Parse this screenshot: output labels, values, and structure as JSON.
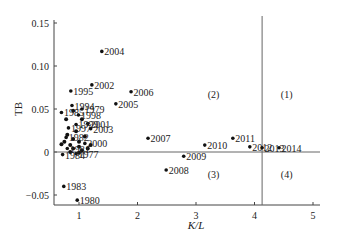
{
  "chart_data": {
    "type": "scatter",
    "title": "",
    "xlabel": "K/L",
    "ylabel": "TB",
    "xlim": [
      0.55,
      5.1
    ],
    "ylim": [
      -0.062,
      0.155
    ],
    "xticks": [
      1,
      2,
      3,
      4,
      5
    ],
    "yticks": [
      0.15,
      0.1,
      0.05,
      0,
      -0.05
    ],
    "ytick_labels": [
      "0.15",
      "0.10",
      "0.05",
      "0",
      "−0.05"
    ],
    "grid": false,
    "reference_lines": {
      "vertical_x": 4.13,
      "horizontal_y": 0
    },
    "quadrant_labels": [
      {
        "label": "(1)",
        "x": 4.55,
        "y": 0.067
      },
      {
        "label": "(2)",
        "x": 3.3,
        "y": 0.067
      },
      {
        "label": "(3)",
        "x": 3.3,
        "y": -0.025
      },
      {
        "label": "(4)",
        "x": 4.55,
        "y": -0.025
      }
    ],
    "points": [
      {
        "label": "2004",
        "x": 1.39,
        "y": 0.117
      },
      {
        "label": "2002",
        "x": 1.22,
        "y": 0.078
      },
      {
        "label": "1995",
        "x": 0.86,
        "y": 0.071
      },
      {
        "label": "2006",
        "x": 1.89,
        "y": 0.07
      },
      {
        "label": "2005",
        "x": 1.63,
        "y": 0.056
      },
      {
        "label": "1994",
        "x": 0.88,
        "y": 0.054
      },
      {
        "label": "1979",
        "x": 1.05,
        "y": 0.05
      },
      {
        "label": "1985",
        "x": 0.7,
        "y": 0.046
      },
      {
        "label": "1998",
        "x": 0.99,
        "y": 0.043
      },
      {
        "label": "2001",
        "x": 1.15,
        "y": 0.033
      },
      {
        "label": "1999",
        "x": 0.95,
        "y": 0.032
      },
      {
        "label": "1997",
        "x": 0.82,
        "y": 0.028
      },
      {
        "label": "2003",
        "x": 1.2,
        "y": 0.027
      },
      {
        "label": "1982",
        "x": 0.78,
        "y": 0.017
      },
      {
        "label": "2000",
        "x": 1.1,
        "y": 0.01
      },
      {
        "label": "1981",
        "x": 0.8,
        "y": 0.004
      },
      {
        "label": "1977",
        "x": 0.95,
        "y": -0.002
      },
      {
        "label": "1984",
        "x": 0.72,
        "y": -0.003
      },
      {
        "label": "2007",
        "x": 2.18,
        "y": 0.016
      },
      {
        "label": "2011",
        "x": 3.63,
        "y": 0.016
      },
      {
        "label": "2010",
        "x": 3.15,
        "y": 0.008
      },
      {
        "label": "2012",
        "x": 3.92,
        "y": 0.006
      },
      {
        "label": "2013",
        "x": 4.13,
        "y": 0.005
      },
      {
        "label": "2014",
        "x": 4.42,
        "y": 0.005
      },
      {
        "label": "2009",
        "x": 2.79,
        "y": -0.005
      },
      {
        "label": "2008",
        "x": 2.49,
        "y": -0.021
      },
      {
        "label": "1983",
        "x": 0.74,
        "y": -0.04
      },
      {
        "label": "1980",
        "x": 0.97,
        "y": -0.056
      }
    ],
    "cluster_extra_points": [
      [
        0.75,
        0.012
      ],
      [
        0.85,
        0.008
      ],
      [
        0.9,
        0.004
      ],
      [
        1.0,
        0.006
      ],
      [
        1.05,
        0.002
      ],
      [
        1.15,
        0.004
      ],
      [
        0.8,
        0.02
      ],
      [
        0.9,
        0.015
      ],
      [
        1.0,
        0.012
      ],
      [
        1.2,
        0.008
      ],
      [
        0.7,
        0.009
      ],
      [
        0.95,
        0.024
      ],
      [
        1.1,
        0.018
      ],
      [
        0.85,
        0.0
      ],
      [
        1.0,
        -0.001
      ],
      [
        0.78,
        0.038
      ],
      [
        1.05,
        0.038
      ],
      [
        0.9,
        0.048
      ]
    ]
  }
}
